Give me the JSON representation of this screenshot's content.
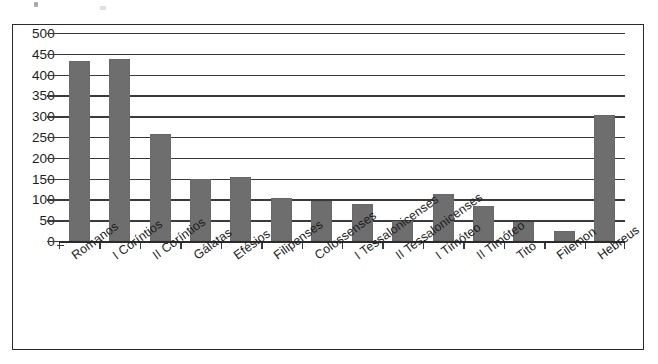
{
  "chart_data": {
    "type": "bar",
    "title": "",
    "subtitle": "",
    "xlabel": "",
    "ylabel": "",
    "ylim": [
      0,
      500
    ],
    "ytick_step": 50,
    "ytick_labels": [
      "500",
      "450",
      "400",
      "350",
      "300",
      "250",
      "200",
      "150",
      "100",
      "50",
      "0"
    ],
    "grid": true,
    "grid_orientation": "horizontal",
    "legend": false,
    "legend_position": "none",
    "bar_color": "#6e6e6e",
    "axis_color": "#2b2b2b",
    "frame_color": "#2b2b2b",
    "background": "#ffffff",
    "categories": [
      "Romanos",
      "I Coríntios",
      "II Coríntios",
      "Gálatas",
      "Efésios",
      "Filipenses",
      "Colossenses",
      "I Tessalonicenses",
      "II Tessalonicenses",
      "I Timóteo",
      "II Timóteo",
      "Tito",
      "Filemon",
      "Hebreus"
    ],
    "values": [
      433,
      437,
      257,
      149,
      155,
      104,
      95,
      89,
      47,
      113,
      83,
      46,
      25,
      303
    ]
  },
  "axis": {
    "y_labels": [
      "500",
      "450",
      "400",
      "350",
      "300",
      "250",
      "200",
      "150",
      "100",
      "50",
      "0"
    ]
  }
}
